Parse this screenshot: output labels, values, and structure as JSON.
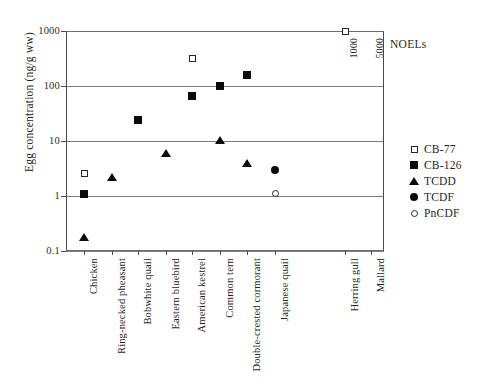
{
  "chart_data": {
    "type": "scatter",
    "title": "",
    "xlabel": "",
    "ylabel": "Egg concentration (ng/g ww)",
    "yscale": "log",
    "ylim": [
      0.1,
      1000
    ],
    "ytick_labels": [
      "1000",
      "100",
      "10",
      "1",
      "0.1"
    ],
    "ytick_values": [
      1000,
      100,
      10,
      1,
      0.1
    ],
    "grid": "horizontal",
    "legend_position": "right",
    "categories": [
      "Chicken",
      "Ring-necked pheasant",
      "Bobwhite quail",
      "Eastern bluebird",
      "American kestrel",
      "Common tern",
      "Double-crested cormorant",
      "Japanese quail",
      "Herring gull",
      "Mallard"
    ],
    "series": [
      {
        "name": "CB-77",
        "marker": "open-square",
        "points": [
          {
            "category": "Chicken",
            "value": 2.6
          },
          {
            "category": "American kestrel",
            "value": 320
          },
          {
            "category": "Herring gull",
            "value": 1000
          },
          {
            "category": "Mallard",
            "value": 5000
          }
        ]
      },
      {
        "name": "CB-126",
        "marker": "filled-square",
        "points": [
          {
            "category": "Chicken",
            "value": 1.1
          },
          {
            "category": "Bobwhite quail",
            "value": 24
          },
          {
            "category": "American kestrel",
            "value": 65
          },
          {
            "category": "Common tern",
            "value": 100
          },
          {
            "category": "Double-crested cormorant",
            "value": 160
          }
        ]
      },
      {
        "name": "TCDD",
        "marker": "filled-triangle",
        "points": [
          {
            "category": "Chicken",
            "value": 0.18
          },
          {
            "category": "Ring-necked pheasant",
            "value": 2.2
          },
          {
            "category": "Eastern bluebird",
            "value": 6.0
          },
          {
            "category": "Common tern",
            "value": 10.5
          },
          {
            "category": "Double-crested cormorant",
            "value": 4.0
          }
        ]
      },
      {
        "name": "TCDF",
        "marker": "filled-circle",
        "points": [
          {
            "category": "Japanese quail",
            "value": 3.0
          }
        ]
      },
      {
        "name": "PnCDF",
        "marker": "open-circle",
        "points": [
          {
            "category": "Japanese quail",
            "value": 1.1
          }
        ]
      }
    ],
    "annotations": {
      "noel_title": "NOELs",
      "noel_values": [
        {
          "category": "Herring gull",
          "label": "1000"
        },
        {
          "category": "Mallard",
          "label": "5000"
        }
      ]
    }
  },
  "legend": {
    "entries": [
      {
        "label": "CB-77",
        "marker": "open-square"
      },
      {
        "label": "CB-126",
        "marker": "filled-square"
      },
      {
        "label": "TCDD",
        "marker": "filled-triangle"
      },
      {
        "label": "TCDF",
        "marker": "filled-circle"
      },
      {
        "label": "PnCDF",
        "marker": "open-circle"
      }
    ]
  }
}
